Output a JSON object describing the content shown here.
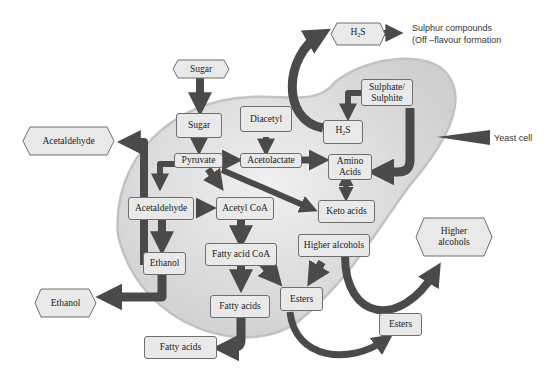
{
  "diagram": {
    "type": "flowchart",
    "colors": {
      "cell_fill": "#d9d9d9",
      "cell_outline": "#bfbfbf",
      "node_fill": "#e9e9e9",
      "node_border": "#6e6e6e",
      "arrow": "#4a4a4a"
    },
    "labels": {
      "yeast_cell": "Yeast cell",
      "sulphur_line1": "Sulphur compounds",
      "sulphur_line2": "(Off –flavour formation"
    },
    "external_nodes": {
      "sugar": "Sugar",
      "h2s_base": "H",
      "h2s_sub": "2",
      "h2s_tail": "S",
      "acetaldehyde": "Acetaldehyde",
      "ethanol": "Ethanol",
      "fatty_acids": "Fatty acids",
      "esters": "Esters",
      "higher_alcohols_line1": "Higher",
      "higher_alcohols_line2": "alcohols"
    },
    "internal_nodes": {
      "sugar": "Sugar",
      "diacetyl": "Diacetyl",
      "sulphate_line1": "Sulphate/",
      "sulphate_line2": "Sulphite",
      "h2s_base": "H",
      "h2s_sub": "2",
      "h2s_tail": "S",
      "pyruvate": "Pyruvate",
      "acetolactate": "Acetolactate",
      "amino_line1": "Amino",
      "amino_line2": "Acids",
      "acetaldehyde": "Acetaldehyde",
      "acetyl_coa": "Acetyl CoA",
      "keto_acids": "Keto acids",
      "ethanol": "Ethanol",
      "fatty_acid_coa": "Fatty acid CoA",
      "higher_alcohols": "Higher alcohols",
      "fatty_acids": "Fatty acids",
      "esters": "Esters"
    },
    "edges": [
      [
        "Sugar (external)",
        "Sugar"
      ],
      [
        "Sugar",
        "Pyruvate"
      ],
      [
        "Pyruvate",
        "Acetolactate"
      ],
      [
        "Pyruvate",
        "Acetaldehyde"
      ],
      [
        "Pyruvate",
        "Acetyl CoA"
      ],
      [
        "Pyruvate",
        "Keto acids"
      ],
      [
        "Pyruvate",
        "Acetaldehyde (external)"
      ],
      [
        "Diacetyl",
        "Acetolactate"
      ],
      [
        "Acetolactate",
        "Amino Acids"
      ],
      [
        "Sulphate/Sulphite",
        "H2S"
      ],
      [
        "Sulphate/Sulphite",
        "Amino Acids"
      ],
      [
        "H2S",
        "H2S (external)"
      ],
      [
        "H2S (external)",
        "Sulphur compounds"
      ],
      [
        "Amino Acids",
        "Keto acids"
      ],
      [
        "Acetaldehyde",
        "Acetyl CoA"
      ],
      [
        "Acetaldehyde",
        "Ethanol"
      ],
      [
        "Ethanol",
        "Ethanol (external)"
      ],
      [
        "Acetyl CoA",
        "Fatty acid CoA"
      ],
      [
        "Fatty acid CoA",
        "Fatty acids"
      ],
      [
        "Fatty acid CoA",
        "Esters"
      ],
      [
        "Higher alcohols",
        "Esters"
      ],
      [
        "Higher alcohols",
        "Higher alcohols (external)"
      ],
      [
        "Fatty acids",
        "Fatty acids (external)"
      ],
      [
        "Esters",
        "Esters (external)"
      ]
    ]
  }
}
